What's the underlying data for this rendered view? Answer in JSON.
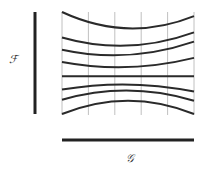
{
  "diagram": {
    "vertical_axis_label": "ℱ",
    "horizontal_axis_label": "𝒢",
    "grid_lines_count": 6,
    "curves": [
      {
        "left": 0.0,
        "mid": 0.16,
        "right": 0.04
      },
      {
        "left": 0.25,
        "mid": 0.33,
        "right": 0.2
      },
      {
        "left": 0.37,
        "mid": 0.42,
        "right": 0.29
      },
      {
        "left": 0.49,
        "mid": 0.54,
        "right": 0.45
      },
      {
        "left": 0.63,
        "mid": 0.63,
        "right": 0.63
      },
      {
        "left": 0.76,
        "mid": 0.71,
        "right": 0.78
      },
      {
        "left": 0.86,
        "mid": 0.77,
        "right": 0.87
      },
      {
        "left": 1.0,
        "mid": 0.87,
        "right": 1.0
      }
    ],
    "colors": {
      "curve": "#2a2a2a",
      "grid": "#b0b0b0",
      "axis": "#222222"
    }
  }
}
